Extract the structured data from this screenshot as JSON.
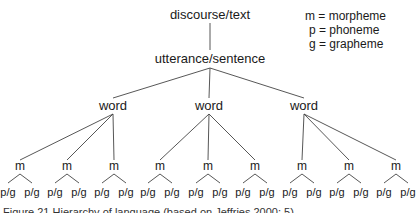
{
  "diagram": {
    "type": "tree",
    "root": {
      "label": "discourse/text",
      "child": {
        "label": "utterance/sentence",
        "words": [
          {
            "label": "word",
            "morphemes": [
              {
                "label": "m",
                "leaves": [
                  "p/g",
                  "p/g"
                ]
              },
              {
                "label": "m",
                "leaves": [
                  "p/g",
                  "p/g"
                ]
              },
              {
                "label": "m",
                "leaves": [
                  "p/g",
                  "p/g"
                ]
              }
            ]
          },
          {
            "label": "word",
            "morphemes": [
              {
                "label": "m",
                "leaves": [
                  "p/g",
                  "p/g"
                ]
              },
              {
                "label": "m",
                "leaves": [
                  "p/g",
                  "p/g"
                ]
              },
              {
                "label": "m",
                "leaves": [
                  "p/g",
                  "p/g"
                ]
              }
            ]
          },
          {
            "label": "word",
            "morphemes": [
              {
                "label": "m",
                "leaves": [
                  "p/g",
                  "p/g"
                ]
              },
              {
                "label": "m",
                "leaves": [
                  "p/g",
                  "p/g"
                ]
              },
              {
                "label": "m",
                "leaves": [
                  "p/g",
                  "p/g"
                ]
              }
            ]
          }
        ]
      }
    },
    "legend": [
      "m = morpheme",
      "p = phoneme",
      "g = grapheme"
    ],
    "caption": "Figure 21 Hierarchy of language (based on Jeffries 2000: 5)"
  }
}
